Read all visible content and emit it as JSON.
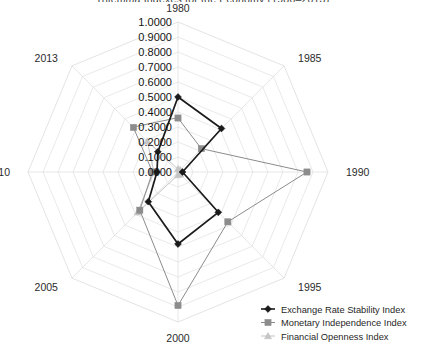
{
  "chart": {
    "title": "Trilemma Indexes for the Economy (1980–2013)",
    "radial_axis": {
      "ticks": [
        "0.0000",
        "0.1000",
        "0.2000",
        "0.3000",
        "0.4000",
        "0.5000",
        "0.6000",
        "0.7000",
        "0.8000",
        "0.9000",
        "1.0000"
      ]
    },
    "spoke_labels": [
      "1980",
      "1985",
      "1990",
      "1995",
      "2000",
      "2005",
      "2010",
      "2013"
    ],
    "legend": [
      {
        "label": "Exchange Rate Stability Index",
        "color": "#1a1a1a",
        "marker": "diamond-marker"
      },
      {
        "label": "Monetary Independence Index",
        "color": "#8c8c8c",
        "marker": "square-marker"
      },
      {
        "label": "Financial Openness Index",
        "color": "#c4c4c4",
        "marker": "triangle-marker"
      }
    ]
  },
  "chart_data": {
    "type": "line",
    "subtype": "radar",
    "title": "Trilemma Indexes for the Economy (1980–2013)",
    "categories": [
      "1980",
      "1985",
      "1990",
      "1995",
      "2000",
      "2005",
      "2010",
      "2013"
    ],
    "xlabel": "Year",
    "ylabel": "Index value",
    "ylim": [
      0.0,
      1.0
    ],
    "ytick_step": 0.1,
    "grid": true,
    "legend_position": "bottom-right",
    "series": [
      {
        "name": "Exchange Rate Stability Index",
        "color": "#1a1a1a",
        "marker": "diamond",
        "values": [
          0.5,
          0.41,
          0.03,
          0.38,
          0.48,
          0.28,
          0.14,
          0.19
        ]
      },
      {
        "name": "Monetary Independence Index",
        "color": "#8c8c8c",
        "marker": "square",
        "values": [
          0.36,
          0.22,
          0.86,
          0.47,
          0.89,
          0.36,
          0.17,
          0.42
        ]
      },
      {
        "name": "Financial Openness Index",
        "color": "#c4c4c4",
        "marker": "triangle",
        "values": [
          0.02,
          0.02,
          0.02,
          0.02,
          0.02,
          0.38,
          0.16,
          0.29
        ]
      }
    ]
  }
}
